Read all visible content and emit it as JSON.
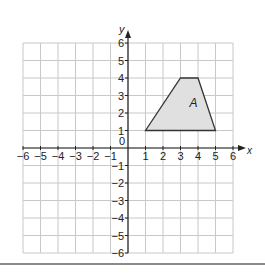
{
  "diagram": {
    "type": "coordinate-grid",
    "x_axis": {
      "label": "x",
      "min": -6,
      "max": 6,
      "ticks": [
        "-6",
        "-5",
        "-4",
        "-3",
        "-2",
        "-1",
        "1",
        "2",
        "3",
        "4",
        "5",
        "6"
      ]
    },
    "y_axis": {
      "label": "y",
      "min": -6,
      "max": 6,
      "ticks": [
        "-6",
        "-5",
        "-4",
        "-3",
        "-2",
        "-1",
        "1",
        "2",
        "3",
        "4",
        "5",
        "6"
      ]
    },
    "origin_label": "0",
    "grid": true,
    "shapes": [
      {
        "name": "A",
        "label": "A",
        "vertices": [
          [
            1,
            1
          ],
          [
            3,
            4
          ],
          [
            4,
            4
          ],
          [
            5,
            1
          ]
        ],
        "fill": "#e0e0e0",
        "stroke": "#333333"
      }
    ]
  },
  "colors": {
    "grid": "#c8c8c8",
    "axis": "#222222",
    "text": "#222222"
  }
}
